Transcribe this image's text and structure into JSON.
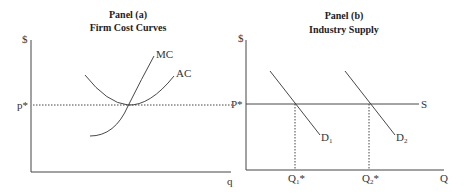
{
  "panel_a": {
    "title_line1": "Panel (a)",
    "title_line2": "Firm Cost Curves",
    "y_axis_label": "$",
    "x_axis_label": "q",
    "price_label": "p*",
    "curves": {
      "mc_label": "MC",
      "ac_label": "AC"
    }
  },
  "panel_b": {
    "title_line1": "Panel (b)",
    "title_line2": "Industry Supply",
    "y_axis_label": "$",
    "x_axis_label": "Q",
    "price_label": "P*",
    "supply_label": "S",
    "demand_1": {
      "letter": "D",
      "sub": "1"
    },
    "demand_2": {
      "letter": "D",
      "sub": "2"
    },
    "q1": {
      "letter": "Q",
      "sub": "1",
      "star": "*"
    },
    "q2": {
      "letter": "Q",
      "sub": "2",
      "star": "*"
    }
  },
  "colors": {
    "line": "#333333",
    "background": "#ffffff"
  }
}
